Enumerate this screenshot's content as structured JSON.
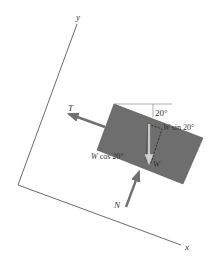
{
  "figure": {
    "type": "free-body diagram",
    "axes": {
      "x_label": "x",
      "y_label": "y"
    },
    "forces": [
      {
        "label": "T",
        "description": "tension, directed up-left along the incline"
      },
      {
        "label": "N",
        "description": "normal force, perpendicular to the incline"
      },
      {
        "label": "W",
        "description": "weight, directed vertically downward"
      }
    ],
    "components": {
      "parallel": {
        "symbol": "W",
        "text": " sin 20°"
      },
      "perpendicular": {
        "symbol": "W",
        "text": " cos 20°"
      }
    },
    "angle_label": "20°",
    "colors": {
      "block": "#6e6e6e",
      "force_arrow": "#707070",
      "weight_arrow": "#c8c8c8",
      "axis": "#444444",
      "text": "#333333"
    }
  }
}
